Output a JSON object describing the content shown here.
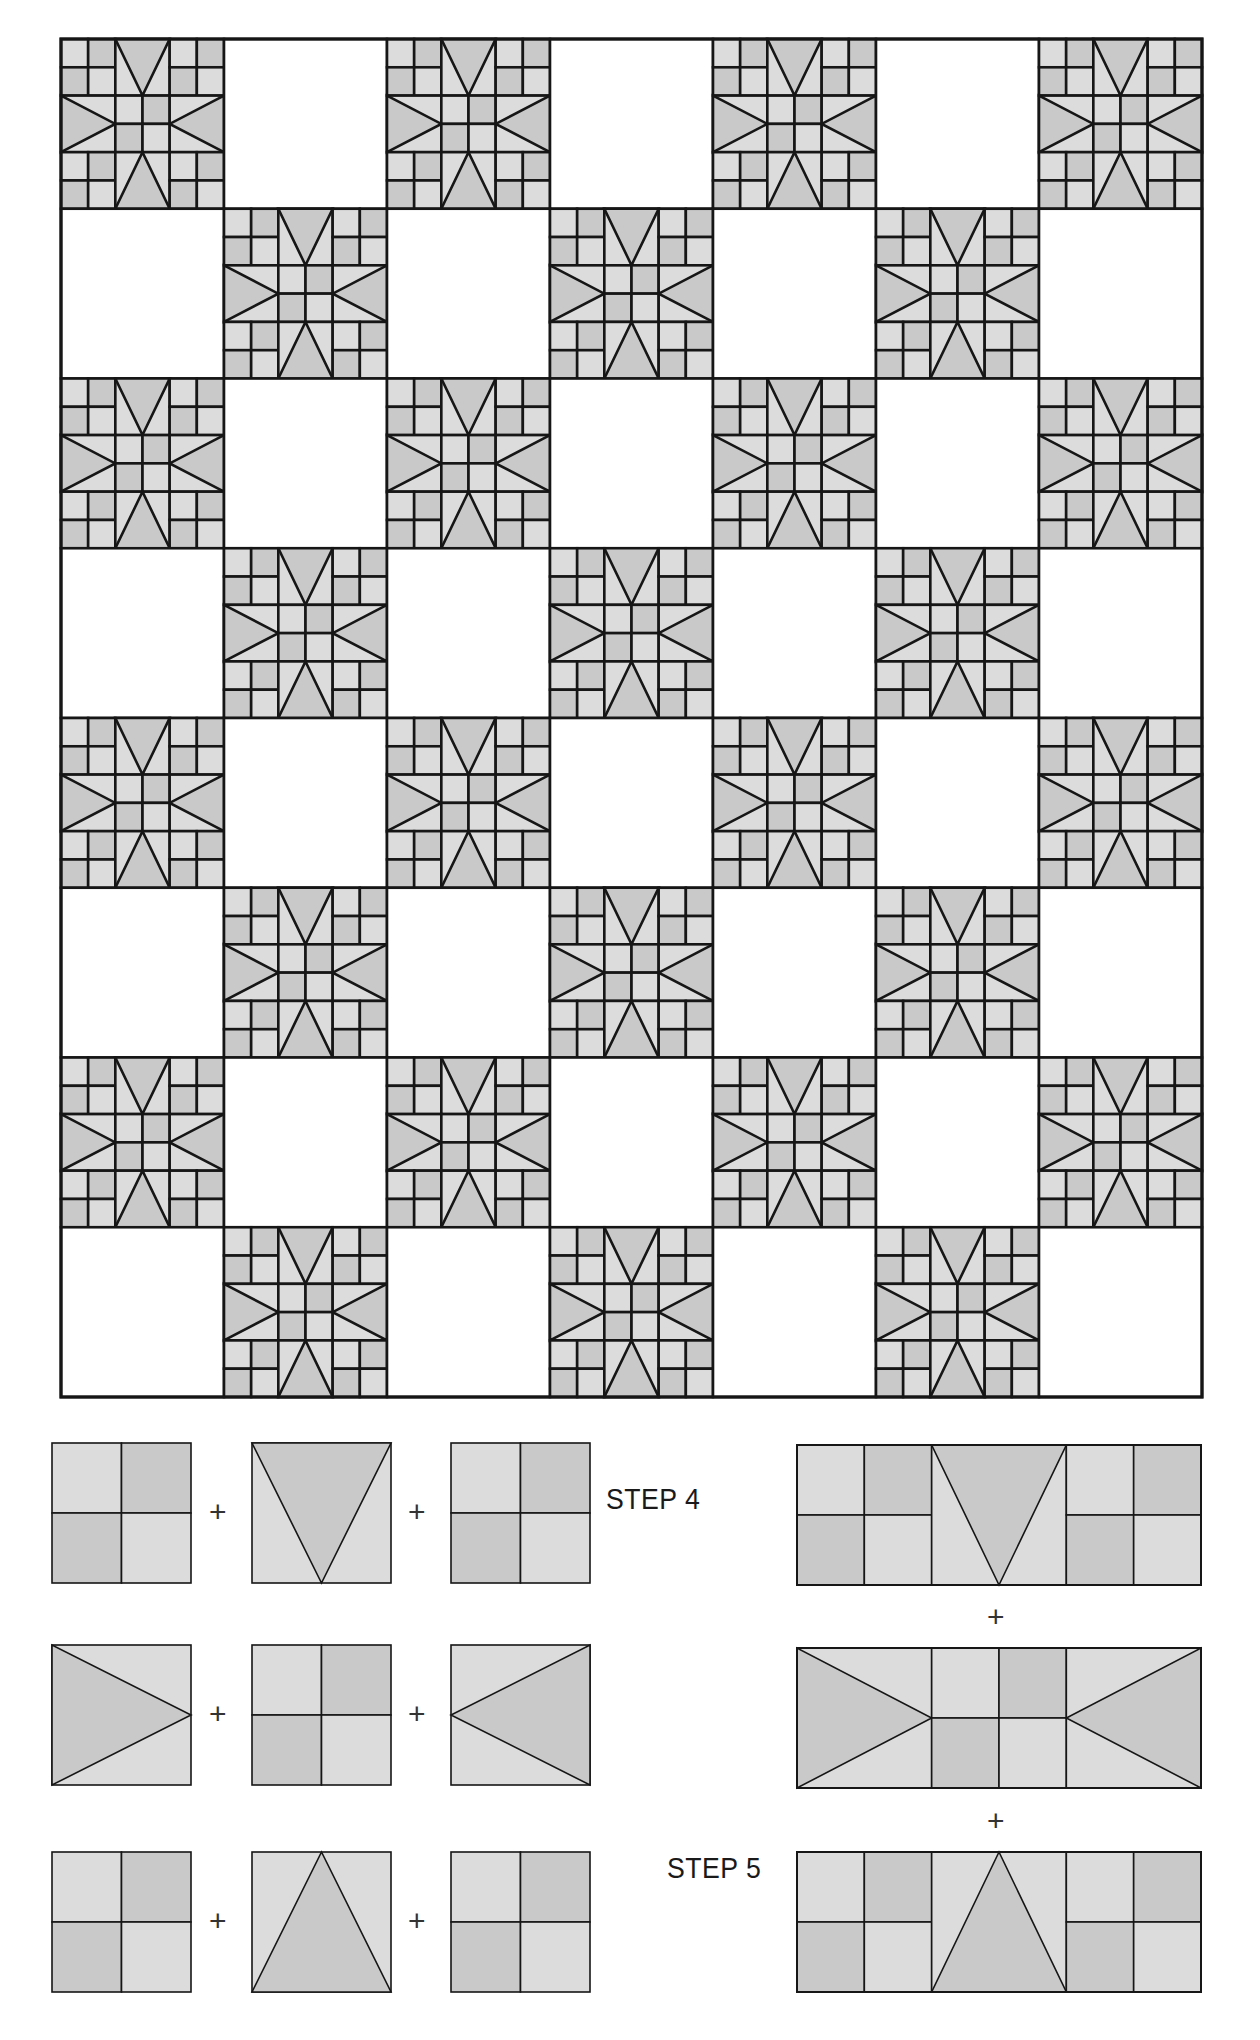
{
  "colors": {
    "light": "#dcdcdc",
    "dark": "#c9c9c9",
    "line": "#161616",
    "background": "#ffffff"
  },
  "quilt": {
    "x": 61,
    "y": 39,
    "cols": 7,
    "rows": 8,
    "block_w": 163,
    "block_h": 169.75,
    "pattern_note": "Alternating star blocks and plain white blocks in a checkerboard; star blocks where (row+col) is even",
    "block_type": "eight-point star with four-patch corners"
  },
  "steps": [
    {
      "id": "step4",
      "label": "STEP 4",
      "x": 606,
      "y": 1483
    },
    {
      "id": "step5",
      "label": "STEP 5",
      "x": 667,
      "y": 1852
    }
  ],
  "plus_label": "+",
  "units": {
    "cols_x": [
      52,
      252,
      451
    ],
    "rows_y": [
      1443,
      1645,
      1852
    ],
    "w": 139,
    "h": 140,
    "layout": [
      [
        "fourpatch",
        "v-triangle",
        "fourpatch"
      ],
      [
        "right-arrow",
        "fourpatch",
        "left-arrow"
      ],
      [
        "fourpatch",
        "a-triangle",
        "fourpatch"
      ]
    ],
    "plus_positions": [
      {
        "x": 209,
        "y": 1497
      },
      {
        "x": 408,
        "y": 1497
      },
      {
        "x": 209,
        "y": 1699
      },
      {
        "x": 408,
        "y": 1699
      },
      {
        "x": 209,
        "y": 1906
      },
      {
        "x": 408,
        "y": 1906
      }
    ]
  },
  "assembled_rows": {
    "x": 797,
    "w": 404,
    "h": 140,
    "rows_y": [
      1445,
      1648,
      1852
    ],
    "plus_positions": [
      {
        "x": 987,
        "y": 1602
      },
      {
        "x": 987,
        "y": 1806
      }
    ]
  }
}
